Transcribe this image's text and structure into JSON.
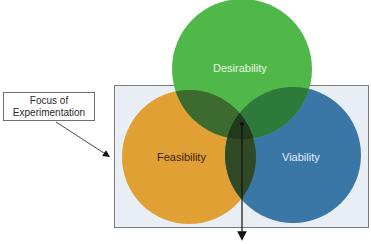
{
  "diagram": {
    "type": "venn",
    "title": "",
    "callout": {
      "line1": "Focus of",
      "line2": "Experimentation"
    },
    "circles": [
      {
        "id": "desirability",
        "label": "Desirability",
        "color": "#4fb848"
      },
      {
        "id": "feasibility",
        "label": "Feasibility",
        "color": "#e0a033"
      },
      {
        "id": "viability",
        "label": "Viability",
        "color": "#3a76a6"
      }
    ],
    "overlap_color": "#2f4a25",
    "frame": {
      "fill": "#e8eef3",
      "stroke": "#7a7a7a"
    },
    "arrow_color": "#111111"
  }
}
